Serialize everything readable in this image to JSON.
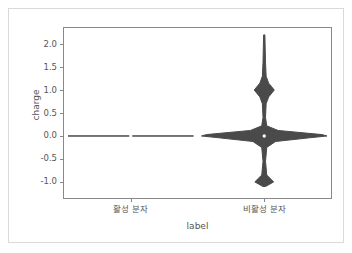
{
  "chart_data": {
    "type": "violin",
    "title": "",
    "xlabel": "label",
    "ylabel": "charge",
    "categories": [
      "활성 분자",
      "비활성 분자"
    ],
    "ylim": [
      -1.35,
      2.35
    ],
    "yticks": [
      2.0,
      1.5,
      1.0,
      0.5,
      0.0,
      -0.5,
      -1.0
    ],
    "ytick_labels": [
      "2.0",
      "1.5",
      "1.0",
      "0.5",
      "0.0",
      "-0.5",
      "-1.0"
    ],
    "grid": false,
    "legend": null,
    "violin_color": "#4a4a4a",
    "median_marker_color": "#ffffff",
    "series": [
      {
        "name": "활성 분자",
        "center": 0.0,
        "median": 0.0,
        "min": 0.0,
        "max": 0.0,
        "note": "zero variance - all charges are 0.0, density collapses to a flat line",
        "density": [
          {
            "y": 0.0,
            "width": 1.0
          }
        ]
      },
      {
        "name": "비활성 분자",
        "center": 0.0,
        "median": 0.0,
        "min": -1.1,
        "max": 2.2,
        "note": "multimodal: dominant peak at 0.0, secondary modes at +1.0 and -1.0, thin tail up to 2.2",
        "density": [
          {
            "y": 2.2,
            "width": 0.01
          },
          {
            "y": 1.6,
            "width": 0.02
          },
          {
            "y": 1.3,
            "width": 0.03
          },
          {
            "y": 1.15,
            "width": 0.07
          },
          {
            "y": 1.0,
            "width": 0.16
          },
          {
            "y": 0.85,
            "width": 0.07
          },
          {
            "y": 0.7,
            "width": 0.03
          },
          {
            "y": 0.4,
            "width": 0.02
          },
          {
            "y": 0.22,
            "width": 0.04
          },
          {
            "y": 0.12,
            "width": 0.22
          },
          {
            "y": 0.03,
            "width": 0.92
          },
          {
            "y": 0.0,
            "width": 1.0
          },
          {
            "y": -0.04,
            "width": 0.72
          },
          {
            "y": -0.12,
            "width": 0.18
          },
          {
            "y": -0.25,
            "width": 0.04
          },
          {
            "y": -0.55,
            "width": 0.02
          },
          {
            "y": -0.85,
            "width": 0.04
          },
          {
            "y": -1.0,
            "width": 0.15
          },
          {
            "y": -1.1,
            "width": 0.02
          }
        ]
      }
    ]
  }
}
